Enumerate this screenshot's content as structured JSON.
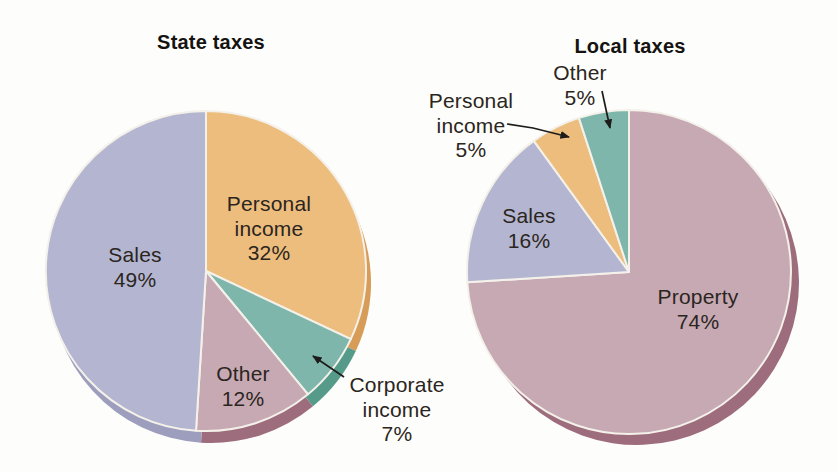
{
  "figure": {
    "background": "#fdfdfb",
    "text_color": "#2b2520",
    "separator_color": "#f4f1ea"
  },
  "labels": {
    "state_title": "State taxes",
    "local_title": "Local taxes",
    "state_sales": "Sales\n49%",
    "state_personal_income": "Personal\nincome\n32%",
    "state_other": "Other\n12%",
    "state_corporate_income": "Corporate\nincome\n7%",
    "local_other": "Other\n5%",
    "local_personal_income": "Personal\nincome\n5%",
    "local_sales": "Sales\n16%",
    "local_property": "Property\n74%"
  },
  "chart_data": [
    {
      "type": "pie",
      "title": "State taxes",
      "start_angle_deg": 0,
      "direction": "clockwise",
      "slices": [
        {
          "label": "Personal income",
          "pct": 32,
          "color": "#edbd7e",
          "shadow": "#d89c59"
        },
        {
          "label": "Corporate income",
          "pct": 7,
          "color": "#7fb6ab",
          "shadow": "#569b8a"
        },
        {
          "label": "Other",
          "pct": 12,
          "color": "#c7a9b4",
          "shadow": "#9e6d7d"
        },
        {
          "label": "Sales",
          "pct": 49,
          "color": "#b4b6d1",
          "shadow": "#9d9ebd"
        }
      ]
    },
    {
      "type": "pie",
      "title": "Local taxes",
      "start_angle_deg": 0,
      "direction": "clockwise",
      "slices": [
        {
          "label": "Property",
          "pct": 74,
          "color": "#c7a9b4",
          "shadow": "#9e6d7d"
        },
        {
          "label": "Sales",
          "pct": 16,
          "color": "#b4b6d1",
          "shadow": "#9d9ebd"
        },
        {
          "label": "Personal income",
          "pct": 5,
          "color": "#edbd7e",
          "shadow": "#d89c59"
        },
        {
          "label": "Other",
          "pct": 5,
          "color": "#7fb6ab",
          "shadow": "#569b8a"
        }
      ]
    }
  ]
}
